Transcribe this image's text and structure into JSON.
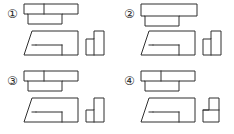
{
  "figure": {
    "kind": "orthographic-projection-multiple-choice",
    "background_color": "#ffffff",
    "line_color": "#2f2f2f",
    "label_color": "#2b2b2b",
    "columns": 2,
    "rows": 2
  },
  "options": [
    {
      "id": "option-1",
      "label": "①",
      "number": "1",
      "top_view": {
        "name": "top-view",
        "description": "Stepped rectangle: upper band full width with vertical divider, lower band offset at left",
        "outline": "2,2 56,2 56,12 40,12 40,22 6,22 6,12 2,12",
        "internal_lines": [
          "22,2 22,12",
          "6,12 40,12"
        ]
      },
      "front_view": {
        "name": "front-view",
        "description": "Trapezoid with diagonal on left side and inner step rectangle at lower right",
        "outline": "10,10 56,10 56,34 2,34",
        "internal_lines": [
          "14,24 40,24",
          "40,24 40,34",
          "10,24 14,24"
        ]
      },
      "side_view": {
        "name": "side-view",
        "description": "L-shape with tall column on right and short block at left",
        "outline": "2,14 10,14 10,2 20,2 20,34 2,34",
        "internal_lines": [
          "10,14 10,34"
        ]
      }
    },
    {
      "id": "option-2",
      "label": "②",
      "number": "2",
      "top_view": {
        "name": "top-view",
        "description": "Full-width outer rectangle with inner rectangle attached below at left",
        "outline": "2,2 56,2 56,14 40,14 40,24 6,24 6,14 2,14",
        "internal_lines": [
          "6,14 40,14"
        ]
      },
      "front_view": {
        "name": "front-view",
        "description": "Trapezoid with diagonal on left side and inner step rectangle at lower right",
        "outline": "10,10 56,10 56,34 2,34",
        "internal_lines": [
          "14,24 40,24",
          "40,24 40,34",
          "10,24 14,24"
        ]
      },
      "side_view": {
        "name": "side-view",
        "description": "L-shape with tall column on right and short block at left",
        "outline": "2,14 10,14 10,2 20,2 20,34 2,34",
        "internal_lines": [
          "10,14 10,34"
        ]
      }
    },
    {
      "id": "option-3",
      "label": "③",
      "number": "3",
      "top_view": {
        "name": "top-view",
        "description": "Stepped rectangle: upper band full width with vertical divider, lower band offset at left",
        "outline": "2,2 56,2 56,12 40,12 40,22 6,22 6,12 2,12",
        "internal_lines": [
          "22,2 22,12",
          "6,12 40,12"
        ]
      },
      "front_view": {
        "name": "front-view",
        "description": "Trapezoid with diagonal on left side and inner step rectangle at lower right",
        "outline": "10,10 56,10 56,34 2,34",
        "internal_lines": [
          "14,24 40,24",
          "40,24 40,34",
          "10,24 14,24"
        ]
      },
      "side_view": {
        "name": "side-view",
        "description": "Mirrored L-shape: tall column on right, notch cut at lower left",
        "outline": "2,20 10,20 10,2 20,2 20,34 2,34",
        "internal_lines": [
          "10,20 10,34"
        ]
      }
    },
    {
      "id": "option-4",
      "label": "④",
      "number": "4",
      "top_view": {
        "name": "top-view",
        "description": "Stepped rectangle: upper band full width with vertical divider, lower band offset at left",
        "outline": "2,2 56,2 56,12 40,12 40,22 6,22 6,12 2,12",
        "internal_lines": [
          "22,2 22,12",
          "6,12 40,12"
        ]
      },
      "front_view": {
        "name": "front-view",
        "description": "Trapezoid with diagonal on left side and inner step rectangle at lower right",
        "outline": "10,10 56,10 56,34 2,34",
        "internal_lines": [
          "14,24 40,24",
          "40,24 40,34",
          "10,24 14,24"
        ]
      },
      "side_view": {
        "name": "side-view",
        "description": "Narrow block on top of a wider block, T-like stepped profile",
        "outline": "8,2 18,2 18,20 18,34 2,34 2,20 8,20",
        "internal_lines": [
          "2,20 18,20"
        ]
      }
    }
  ]
}
